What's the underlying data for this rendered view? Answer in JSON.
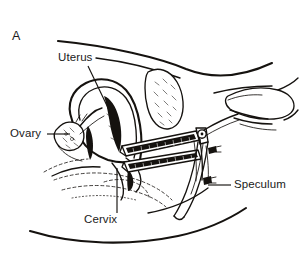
{
  "figure": {
    "panel_letter": "A",
    "background_color": "#ffffff",
    "ink_color": "#15120f",
    "width": 300,
    "height": 270,
    "labels": [
      {
        "id": "uterus",
        "text": "Uterus",
        "leader": "diagonal-down-right"
      },
      {
        "id": "ovary",
        "text": "Ovary",
        "leader": "horizontal-right"
      },
      {
        "id": "cervix",
        "text": "Cervix",
        "leader": "vertical-up"
      },
      {
        "id": "speculum",
        "text": "Speculum",
        "leader": "horizontal-left"
      }
    ],
    "structures": [
      "abdominal-wall-contour",
      "uterus-body",
      "uterine-cavity",
      "bladder",
      "ovary",
      "fallopian-tube",
      "cervix",
      "vaginal-canal",
      "speculum-upper-blade",
      "speculum-lower-blade",
      "speculum-hinge",
      "speculum-thumbscrew",
      "speculum-handle",
      "examiner-hand",
      "buttock-contour",
      "thigh-contour"
    ]
  }
}
